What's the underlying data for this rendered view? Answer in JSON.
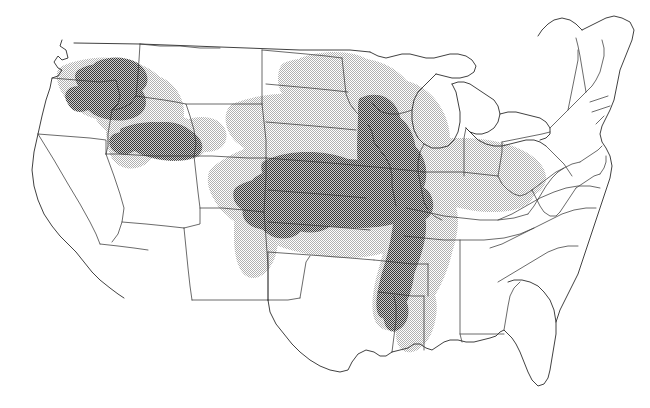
{
  "figure": {
    "kind": "choropleth-range-map",
    "region": "Contiguous United States",
    "title": "",
    "caption": "",
    "background_color": "#ffffff",
    "outline_color": "#3a3a3a",
    "coast_color": "#2b2b2b"
  },
  "legend": {
    "visible": false,
    "entries": [
      {
        "label": "Core / high density range",
        "swatch": "#808080",
        "pattern": "dark-halftone"
      },
      {
        "label": "Peripheral / lower density range",
        "swatch": "#d5d5d5",
        "pattern": "light-halftone"
      },
      {
        "label": "Outside range",
        "swatch": "#ffffff",
        "pattern": "none"
      }
    ]
  },
  "zones": {
    "dark": {
      "name": "core-range",
      "color": "#808080",
      "opacity": 1,
      "areas": [
        "Eastern Washington / Palouse",
        "Northern Idaho panhandle",
        "Snake River Plain, southern Idaho",
        "Eastern Nebraska",
        "Northern and eastern Kansas",
        "Southern Iowa",
        "Northern Missouri",
        "Western Illinois",
        "Southeastern Minnesota / western Wisconsin",
        "Mississippi River valley: Missouri bootheel, eastern Arkansas, Mississippi Delta, northeastern Louisiana"
      ]
    },
    "light": {
      "name": "peripheral-range",
      "color": "#d5d5d5",
      "opacity": 1,
      "areas": [
        "Central and eastern Washington",
        "Northeastern Oregon",
        "Central Idaho",
        "Eastern Montana",
        "Western and central North Dakota",
        "South Dakota",
        "Western Nebraska",
        "Central and western Kansas",
        "Northern Oklahoma panhandle edge",
        "Minnesota",
        "Wisconsin",
        "Iowa",
        "Missouri",
        "Illinois",
        "Indiana",
        "Western Ohio",
        "Western Kentucky and Tennessee",
        "Arkansas",
        "Mississippi",
        "Eastern Louisiana edge"
      ]
    },
    "unshaded": {
      "name": "outside-range",
      "color": "#ffffff",
      "areas": [
        "California",
        "Nevada",
        "Arizona",
        "New Mexico",
        "Utah",
        "Texas",
        "Florida",
        "Georgia",
        "South Carolina",
        "North Carolina",
        "Virginia",
        "Northeast states",
        "Maine",
        "Michigan"
      ]
    }
  },
  "states": [
    {
      "code": "WA",
      "name": "Washington"
    },
    {
      "code": "OR",
      "name": "Oregon"
    },
    {
      "code": "CA",
      "name": "California"
    },
    {
      "code": "ID",
      "name": "Idaho"
    },
    {
      "code": "NV",
      "name": "Nevada"
    },
    {
      "code": "MT",
      "name": "Montana"
    },
    {
      "code": "WY",
      "name": "Wyoming"
    },
    {
      "code": "UT",
      "name": "Utah"
    },
    {
      "code": "AZ",
      "name": "Arizona"
    },
    {
      "code": "CO",
      "name": "Colorado"
    },
    {
      "code": "NM",
      "name": "New Mexico"
    },
    {
      "code": "ND",
      "name": "North Dakota"
    },
    {
      "code": "SD",
      "name": "South Dakota"
    },
    {
      "code": "NE",
      "name": "Nebraska"
    },
    {
      "code": "KS",
      "name": "Kansas"
    },
    {
      "code": "OK",
      "name": "Oklahoma"
    },
    {
      "code": "TX",
      "name": "Texas"
    },
    {
      "code": "MN",
      "name": "Minnesota"
    },
    {
      "code": "IA",
      "name": "Iowa"
    },
    {
      "code": "MO",
      "name": "Missouri"
    },
    {
      "code": "AR",
      "name": "Arkansas"
    },
    {
      "code": "LA",
      "name": "Louisiana"
    },
    {
      "code": "WI",
      "name": "Wisconsin"
    },
    {
      "code": "IL",
      "name": "Illinois"
    },
    {
      "code": "MI",
      "name": "Michigan"
    },
    {
      "code": "IN",
      "name": "Indiana"
    },
    {
      "code": "OH",
      "name": "Ohio"
    },
    {
      "code": "KY",
      "name": "Kentucky"
    },
    {
      "code": "TN",
      "name": "Tennessee"
    },
    {
      "code": "MS",
      "name": "Mississippi"
    },
    {
      "code": "AL",
      "name": "Alabama"
    },
    {
      "code": "GA",
      "name": "Georgia"
    },
    {
      "code": "FL",
      "name": "Florida"
    },
    {
      "code": "SC",
      "name": "South Carolina"
    },
    {
      "code": "NC",
      "name": "North Carolina"
    },
    {
      "code": "VA",
      "name": "Virginia"
    },
    {
      "code": "WV",
      "name": "West Virginia"
    },
    {
      "code": "MD",
      "name": "Maryland"
    },
    {
      "code": "DE",
      "name": "Delaware"
    },
    {
      "code": "PA",
      "name": "Pennsylvania"
    },
    {
      "code": "NJ",
      "name": "New Jersey"
    },
    {
      "code": "NY",
      "name": "New York"
    },
    {
      "code": "CT",
      "name": "Connecticut"
    },
    {
      "code": "RI",
      "name": "Rhode Island"
    },
    {
      "code": "MA",
      "name": "Massachusetts"
    },
    {
      "code": "VT",
      "name": "Vermont"
    },
    {
      "code": "NH",
      "name": "New Hampshire"
    },
    {
      "code": "ME",
      "name": "Maine"
    }
  ]
}
